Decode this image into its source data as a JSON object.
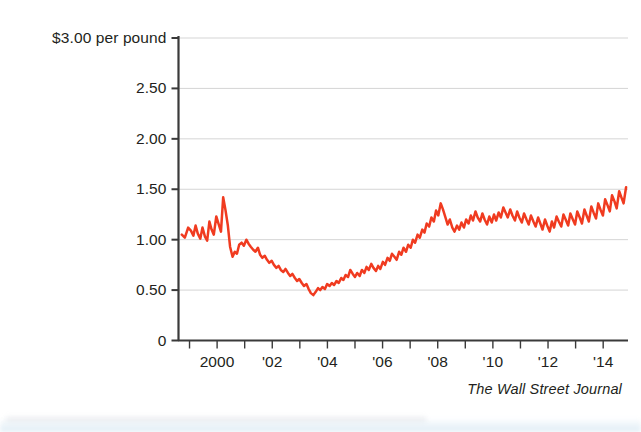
{
  "chart_data": {
    "type": "line",
    "title": "",
    "subtitle": "",
    "xlabel": "",
    "ylabel": "$3.00 per pound",
    "ylim": [
      0,
      3.0
    ],
    "xlim": [
      1998.6,
      2014.9
    ],
    "grid": true,
    "legend_position": "none",
    "line_color": "#F03B20",
    "source": "The Wall Street Journal",
    "y_ticks": [
      {
        "value": 3.0,
        "label": "$3.00 per pound"
      },
      {
        "value": 2.5,
        "label": "2.50"
      },
      {
        "value": 2.0,
        "label": "2.00"
      },
      {
        "value": 1.5,
        "label": "1.50"
      },
      {
        "value": 1.0,
        "label": "1.00"
      },
      {
        "value": 0.5,
        "label": "0.50"
      },
      {
        "value": 0.0,
        "label": "0"
      }
    ],
    "x_ticks": [
      {
        "value": 1999,
        "label": ""
      },
      {
        "value": 2000,
        "label": "2000"
      },
      {
        "value": 2001,
        "label": ""
      },
      {
        "value": 2002,
        "label": "'02"
      },
      {
        "value": 2003,
        "label": ""
      },
      {
        "value": 2004,
        "label": "'04"
      },
      {
        "value": 2005,
        "label": ""
      },
      {
        "value": 2006,
        "label": "'06"
      },
      {
        "value": 2007,
        "label": ""
      },
      {
        "value": 2008,
        "label": "'08"
      },
      {
        "value": 2009,
        "label": ""
      },
      {
        "value": 2010,
        "label": "'10"
      },
      {
        "value": 2011,
        "label": ""
      },
      {
        "value": 2012,
        "label": "'12"
      },
      {
        "value": 2013,
        "label": ""
      },
      {
        "value": 2014,
        "label": "'14"
      }
    ],
    "series": [
      {
        "name": "Price per pound",
        "x": [
          1998.72,
          1998.83,
          1998.95,
          1999.05,
          1999.14,
          1999.22,
          1999.3,
          1999.39,
          1999.47,
          1999.56,
          1999.64,
          1999.72,
          1999.8,
          1999.88,
          1999.97,
          2000.05,
          2000.14,
          2000.22,
          2000.3,
          2000.39,
          2000.47,
          2000.56,
          2000.64,
          2000.72,
          2000.8,
          2000.89,
          2000.97,
          2001.06,
          2001.14,
          2001.22,
          2001.31,
          2001.39,
          2001.48,
          2001.56,
          2001.64,
          2001.73,
          2001.81,
          2001.89,
          2001.98,
          2002.06,
          2002.15,
          2002.23,
          2002.31,
          2002.4,
          2002.48,
          2002.57,
          2002.65,
          2002.73,
          2002.82,
          2002.9,
          2002.98,
          2003.07,
          2003.15,
          2003.24,
          2003.32,
          2003.4,
          2003.49,
          2003.57,
          2003.66,
          2003.74,
          2003.82,
          2003.91,
          2003.99,
          2004.08,
          2004.16,
          2004.24,
          2004.33,
          2004.41,
          2004.5,
          2004.58,
          2004.66,
          2004.75,
          2004.83,
          2004.92,
          2005.0,
          2005.08,
          2005.17,
          2005.25,
          2005.34,
          2005.42,
          2005.5,
          2005.59,
          2005.67,
          2005.76,
          2005.84,
          2005.92,
          2006.01,
          2006.09,
          2006.18,
          2006.26,
          2006.34,
          2006.43,
          2006.51,
          2006.6,
          2006.68,
          2006.76,
          2006.85,
          2006.93,
          2007.02,
          2007.1,
          2007.18,
          2007.27,
          2007.35,
          2007.44,
          2007.52,
          2007.6,
          2007.69,
          2007.77,
          2007.86,
          2007.94,
          2008.02,
          2008.11,
          2008.19,
          2008.28,
          2008.36,
          2008.44,
          2008.53,
          2008.61,
          2008.7,
          2008.78,
          2008.86,
          2008.95,
          2009.03,
          2009.12,
          2009.2,
          2009.28,
          2009.37,
          2009.45,
          2009.54,
          2009.62,
          2009.7,
          2009.79,
          2009.87,
          2009.96,
          2010.04,
          2010.12,
          2010.21,
          2010.29,
          2010.38,
          2010.46,
          2010.54,
          2010.63,
          2010.71,
          2010.8,
          2010.88,
          2010.96,
          2011.05,
          2011.13,
          2011.22,
          2011.3,
          2011.38,
          2011.47,
          2011.55,
          2011.64,
          2011.72,
          2011.8,
          2011.89,
          2011.97,
          2012.06,
          2012.14,
          2012.22,
          2012.31,
          2012.39,
          2012.48,
          2012.56,
          2012.64,
          2012.73,
          2012.81,
          2012.9,
          2012.98,
          2013.06,
          2013.15,
          2013.23,
          2013.32,
          2013.4,
          2013.48,
          2013.57,
          2013.65,
          2013.74,
          2013.82,
          2013.9,
          2013.99,
          2014.07,
          2014.16,
          2014.24,
          2014.32,
          2014.41,
          2014.49,
          2014.58,
          2014.66,
          2014.74,
          2014.83
        ],
        "values": [
          1.05,
          1.02,
          1.12,
          1.09,
          1.04,
          1.14,
          1.06,
          1.01,
          1.12,
          1.03,
          0.99,
          1.18,
          1.1,
          1.05,
          1.23,
          1.16,
          1.08,
          1.42,
          1.3,
          1.14,
          0.93,
          0.83,
          0.88,
          0.86,
          0.95,
          0.97,
          0.94,
          1.0,
          0.96,
          0.93,
          0.9,
          0.88,
          0.92,
          0.85,
          0.82,
          0.84,
          0.8,
          0.77,
          0.79,
          0.75,
          0.72,
          0.74,
          0.7,
          0.68,
          0.71,
          0.67,
          0.64,
          0.66,
          0.62,
          0.59,
          0.61,
          0.57,
          0.54,
          0.56,
          0.51,
          0.47,
          0.45,
          0.48,
          0.52,
          0.5,
          0.53,
          0.51,
          0.56,
          0.54,
          0.57,
          0.55,
          0.59,
          0.57,
          0.62,
          0.6,
          0.65,
          0.63,
          0.7,
          0.66,
          0.63,
          0.67,
          0.64,
          0.7,
          0.67,
          0.73,
          0.7,
          0.76,
          0.72,
          0.69,
          0.74,
          0.71,
          0.78,
          0.75,
          0.82,
          0.79,
          0.86,
          0.83,
          0.8,
          0.88,
          0.85,
          0.92,
          0.88,
          0.95,
          0.92,
          1.0,
          0.97,
          1.05,
          1.02,
          1.1,
          1.07,
          1.16,
          1.13,
          1.22,
          1.18,
          1.29,
          1.24,
          1.36,
          1.3,
          1.22,
          1.15,
          1.2,
          1.12,
          1.08,
          1.14,
          1.1,
          1.17,
          1.12,
          1.2,
          1.16,
          1.24,
          1.19,
          1.28,
          1.22,
          1.18,
          1.26,
          1.2,
          1.15,
          1.23,
          1.17,
          1.25,
          1.19,
          1.27,
          1.22,
          1.32,
          1.27,
          1.22,
          1.3,
          1.24,
          1.19,
          1.28,
          1.22,
          1.17,
          1.26,
          1.2,
          1.15,
          1.24,
          1.18,
          1.13,
          1.22,
          1.16,
          1.1,
          1.2,
          1.14,
          1.08,
          1.18,
          1.12,
          1.23,
          1.18,
          1.13,
          1.25,
          1.2,
          1.14,
          1.26,
          1.2,
          1.15,
          1.28,
          1.22,
          1.16,
          1.3,
          1.24,
          1.18,
          1.33,
          1.27,
          1.21,
          1.36,
          1.3,
          1.24,
          1.4,
          1.34,
          1.28,
          1.44,
          1.38,
          1.31,
          1.48,
          1.42,
          1.36,
          1.52
        ]
      }
    ],
    "annotations": []
  },
  "axis": {
    "y_axis_name": "y-axis",
    "x_axis_name": "x-axis"
  },
  "source_credit": "The Wall Street Journal"
}
